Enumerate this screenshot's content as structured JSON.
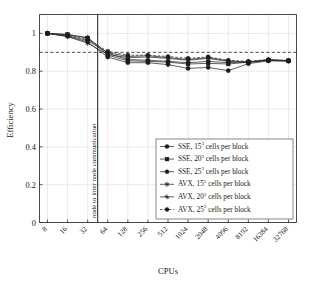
{
  "chart_data": {
    "type": "line",
    "title": "",
    "xlabel": "CPUs",
    "ylabel": "Efficiency",
    "x_scale": "log2",
    "categories": [
      8,
      16,
      32,
      64,
      128,
      256,
      512,
      1024,
      2048,
      4096,
      8192,
      16384,
      32768
    ],
    "xtick_labels": [
      "8",
      "16",
      "32",
      "64",
      "128",
      "256",
      "512",
      "1024",
      "2048",
      "4096",
      "8192",
      "16384",
      "32768"
    ],
    "ytick_labels": [
      "0",
      "0.2",
      "0.4",
      "0.6",
      "0.8",
      "1"
    ],
    "ytick_values": [
      0,
      0.2,
      0.4,
      0.6,
      0.8,
      1
    ],
    "ylim": [
      0,
      1.1
    ],
    "grid": true,
    "legend_position": "lower right",
    "reference_line": {
      "y": 0.9,
      "style": "dashed",
      "label": ""
    },
    "vertical_line": {
      "x_between": "32-64",
      "label": "node to inter node communication"
    },
    "series": [
      {
        "name": "SSE, 15³ cells per block",
        "label_prefix": "SSE, ",
        "label_base": "15",
        "label_exp": "3",
        "label_suffix": " cells per block",
        "marker": "circle-filled",
        "line_style": "solid",
        "values": [
          1.0,
          0.985,
          0.955,
          0.875,
          0.845,
          0.845,
          0.835,
          0.815,
          0.82,
          0.803,
          0.84,
          0.855,
          0.853
        ]
      },
      {
        "name": "SSE, 20³ cells per block",
        "label_prefix": "SSE, ",
        "label_base": "20",
        "label_exp": "3",
        "label_suffix": " cells per block",
        "marker": "square-filled",
        "line_style": "solid",
        "values": [
          1.0,
          0.995,
          0.975,
          0.885,
          0.855,
          0.852,
          0.848,
          0.838,
          0.842,
          0.838,
          0.848,
          0.857,
          0.855
        ]
      },
      {
        "name": "SSE, 25³ cells per block",
        "label_prefix": "SSE, ",
        "label_base": "25",
        "label_exp": "3",
        "label_suffix": " cells per block",
        "marker": "pentagon-filled",
        "line_style": "solid",
        "values": [
          1.0,
          0.993,
          0.978,
          0.895,
          0.862,
          0.858,
          0.852,
          0.845,
          0.852,
          0.845,
          0.85,
          0.858,
          0.855
        ]
      },
      {
        "name": "AVX, 15³ cells per block",
        "label_prefix": "AVX, ",
        "label_base": "15",
        "label_exp": "3",
        "label_suffix": " cells per block",
        "marker": "star",
        "line_style": "solid",
        "values": [
          1.0,
          0.983,
          0.948,
          0.888,
          0.872,
          0.875,
          0.868,
          0.858,
          0.868,
          0.852,
          0.846,
          0.86,
          0.855
        ]
      },
      {
        "name": "AVX, 20³ cells per block",
        "label_prefix": "AVX, ",
        "label_base": "20",
        "label_exp": "3",
        "label_suffix": " cells per block",
        "marker": "plus",
        "line_style": "solid",
        "values": [
          1.0,
          0.988,
          0.962,
          0.898,
          0.878,
          0.882,
          0.872,
          0.862,
          0.872,
          0.855,
          0.849,
          0.861,
          0.856
        ]
      },
      {
        "name": "AVX, 25³ cells per block",
        "label_prefix": "AVX, ",
        "label_base": "25",
        "label_exp": "3",
        "label_suffix": " cells per block",
        "marker": "circle-filled",
        "line_style": "dashed",
        "values": [
          1.0,
          0.99,
          0.968,
          0.905,
          0.885,
          0.885,
          0.878,
          0.868,
          0.876,
          0.858,
          0.852,
          0.862,
          0.857
        ]
      }
    ]
  },
  "axes": {
    "y_title": "Efficiency",
    "x_title": "CPUs"
  },
  "annotation": {
    "vertical_text": "node to inter node communication"
  },
  "colors": {
    "line": "#2b2b2b",
    "grid": "#d3d3d3",
    "axis": "#1a1a1a",
    "legend_border": "#555555",
    "background": "#ffffff"
  }
}
